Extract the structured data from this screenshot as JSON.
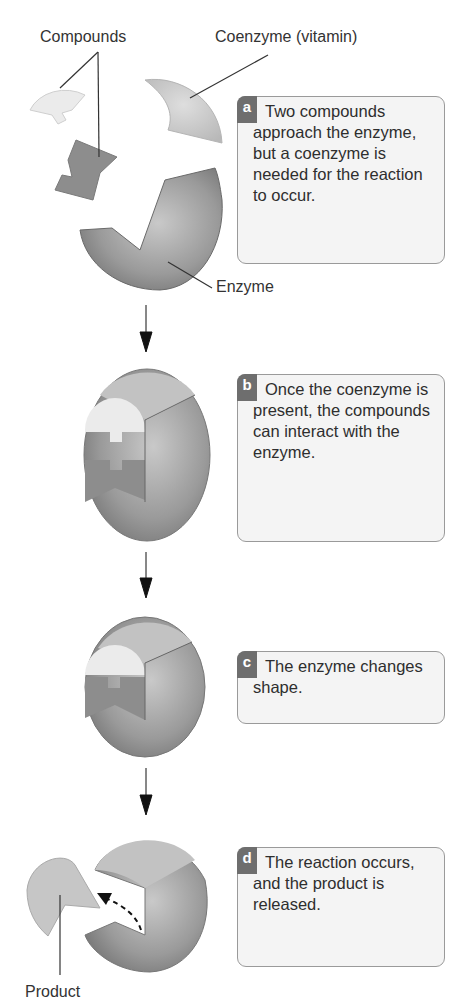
{
  "labels": {
    "compounds": "Compounds",
    "coenzyme": "Coenzyme (vitamin)",
    "enzyme": "Enzyme",
    "product": "Product"
  },
  "steps": [
    {
      "letter": "a",
      "text": "Two compounds approach the enzyme, but a coenzyme is needed for the reaction to occur."
    },
    {
      "letter": "b",
      "text": "Once the coenzyme is present, the compounds can interact with the enzyme."
    },
    {
      "letter": "c",
      "text": "The enzyme changes shape."
    },
    {
      "letter": "d",
      "text": "The reaction occurs, and the product is released."
    }
  ],
  "colors": {
    "badge": "#6e6e6e",
    "enzyme_dark": "#7a7a7a",
    "compound_light": "#e4e4e4",
    "coenzyme": "#c8c8c8",
    "box_border": "#9a9a9a"
  }
}
